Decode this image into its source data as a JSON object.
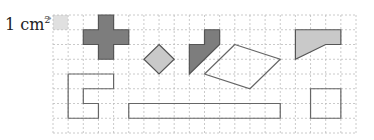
{
  "unit_label": {
    "text": "1 cm",
    "superscript": "2",
    "arrow": "→"
  },
  "grid": {
    "cols": 20,
    "rows": 8,
    "origin_px": [
      53,
      15
    ],
    "size_px": [
      303,
      118
    ],
    "line_color": "#bdbdbd",
    "unit_cell": {
      "col": 0,
      "row": 0,
      "fill": "#e0e0e0"
    }
  },
  "colors": {
    "dark_fill": "#7d7d7d",
    "light_fill": "#c9c9c9",
    "stroke": "#555555",
    "outline_stroke": "#666666"
  },
  "shapes": [
    {
      "name": "cross",
      "fill": "dark",
      "points": [
        [
          3,
          0
        ],
        [
          4,
          0
        ],
        [
          4,
          1
        ],
        [
          5,
          1
        ],
        [
          5,
          2
        ],
        [
          4,
          2
        ],
        [
          4,
          3
        ],
        [
          3,
          3
        ],
        [
          3,
          2
        ],
        [
          2,
          2
        ],
        [
          2,
          1
        ],
        [
          3,
          1
        ]
      ]
    },
    {
      "name": "diamond",
      "fill": "light",
      "points": [
        [
          7,
          2
        ],
        [
          8,
          3
        ],
        [
          7,
          4
        ],
        [
          6,
          3
        ]
      ]
    },
    {
      "name": "hook",
      "fill": "dark",
      "points": [
        [
          9,
          2
        ],
        [
          10,
          2
        ],
        [
          10,
          1
        ],
        [
          11,
          1
        ],
        [
          11,
          2
        ],
        [
          9,
          4
        ]
      ]
    },
    {
      "name": "parallelogram",
      "fill": "none",
      "points": [
        [
          12,
          2
        ],
        [
          15,
          3
        ],
        [
          13,
          5
        ],
        [
          10,
          4
        ]
      ]
    },
    {
      "name": "trapezoid-shape",
      "fill": "light",
      "points": [
        [
          16,
          1
        ],
        [
          19,
          1
        ],
        [
          19,
          2
        ],
        [
          18,
          2
        ],
        [
          16,
          3
        ]
      ]
    },
    {
      "name": "c-shape",
      "fill": "none",
      "points": [
        [
          1,
          4
        ],
        [
          4,
          4
        ],
        [
          4,
          5
        ],
        [
          2,
          5
        ],
        [
          2,
          6
        ],
        [
          3,
          6
        ],
        [
          3,
          7
        ],
        [
          1,
          7
        ]
      ]
    },
    {
      "name": "long-rectangle",
      "fill": "none",
      "points": [
        [
          5,
          6
        ],
        [
          15,
          6
        ],
        [
          15,
          7
        ],
        [
          5,
          7
        ]
      ]
    },
    {
      "name": "square",
      "fill": "none",
      "points": [
        [
          17,
          5
        ],
        [
          19,
          5
        ],
        [
          19,
          7
        ],
        [
          17,
          7
        ]
      ]
    }
  ]
}
